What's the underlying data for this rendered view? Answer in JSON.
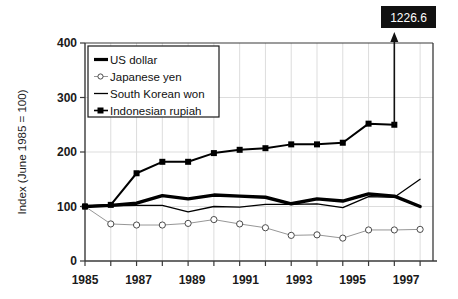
{
  "chart_data": {
    "type": "line",
    "title": "",
    "subtitle": "",
    "xlabel": "",
    "ylabel": "Index (June 1985 = 100)",
    "xlim": [
      1985,
      1998.5
    ],
    "ylim": [
      0,
      400
    ],
    "yticks": [
      0,
      100,
      200,
      300,
      400
    ],
    "ytick_labels": [
      "0",
      "100",
      "200",
      "300",
      "400"
    ],
    "xticks": [
      1985,
      1986,
      1987,
      1988,
      1989,
      1990,
      1991,
      1992,
      1993,
      1994,
      1995,
      1996,
      1997,
      1998
    ],
    "xtick_labels_shown": [
      "1985",
      "1987",
      "1989",
      "1991",
      "1993",
      "1995",
      "1997"
    ],
    "xtick_labels_values": [
      1985,
      1987,
      1989,
      1991,
      1993,
      1995,
      1997
    ],
    "grid": "light vertical gridlines at every year and light horizontal gridlines at 100, 200, 300",
    "legend_position": "upper-left inside plot area",
    "x": [
      1985,
      1986,
      1987,
      1988,
      1989,
      1990,
      1991,
      1992,
      1993,
      1994,
      1995,
      1996,
      1997,
      1998
    ],
    "series": [
      {
        "name": "US dollar",
        "style": "thick-black-line",
        "marker": "none",
        "color": "#000000",
        "values": [
          100,
          102,
          106,
          120,
          114,
          121,
          119,
          117,
          105,
          114,
          110,
          123,
          119,
          100
        ]
      },
      {
        "name": "Japanese yen",
        "style": "thin-gray-line-open-circles",
        "marker": "open-circle",
        "color": "#555555",
        "values": [
          100,
          68,
          66,
          66,
          69,
          76,
          68,
          61,
          47,
          48,
          42,
          57,
          57,
          58
        ]
      },
      {
        "name": "South Korean won",
        "style": "thin-black-line",
        "marker": "none",
        "color": "#000000",
        "values": [
          100,
          101,
          102,
          102,
          90,
          100,
          99,
          104,
          104,
          105,
          98,
          118,
          117,
          150
        ]
      },
      {
        "name": "Indonesian rupiah",
        "style": "thick-black-line-filled-squares",
        "marker": "filled-square",
        "color": "#000000",
        "values": [
          100,
          103,
          161,
          182,
          182,
          198,
          204,
          207,
          214,
          214,
          217,
          252,
          250,
          1226.6
        ]
      }
    ],
    "annotations": [
      {
        "label": "1226.6",
        "series": "Indonesian rupiah",
        "x": 1998,
        "value": 1226.6,
        "style": "black box with white text and upward arrow from last plotted point",
        "box_fill": "#111111",
        "text_color": "#ffffff"
      }
    ]
  },
  "legend": {
    "items": [
      {
        "label": "US dollar",
        "key": "us-dollar"
      },
      {
        "label": "Japanese yen",
        "key": "japanese-yen"
      },
      {
        "label": "South Korean won",
        "key": "south-korean-won"
      },
      {
        "label": "Indonesian rupiah",
        "key": "indonesian-rupiah"
      }
    ]
  },
  "axes": {
    "y_title": "Index (June 1985 = 100)",
    "y_tick_0": "0",
    "y_tick_100": "100",
    "y_tick_200": "200",
    "y_tick_300": "300",
    "y_tick_400": "400",
    "x_tick_1985": "1985",
    "x_tick_1987": "1987",
    "x_tick_1989": "1989",
    "x_tick_1991": "1991",
    "x_tick_1993": "1993",
    "x_tick_1995": "1995",
    "x_tick_1997": "1997"
  },
  "callout": {
    "value_label": "1226.6"
  },
  "colors": {
    "ink": "#000000",
    "axis": "#3a3a3a",
    "grid": "#d9d9d9",
    "yen_line": "#6b6b6b",
    "callout_bg": "#111111",
    "callout_fg": "#ffffff",
    "background": "#ffffff"
  }
}
